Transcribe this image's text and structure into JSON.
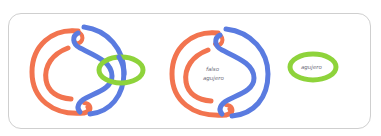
{
  "diagram": {
    "colors": {
      "orange": "#F2744F",
      "blue": "#5A7BE0",
      "green": "#8ED33B",
      "border": "#cfcfcf",
      "text": "#6a6a7a"
    },
    "figures": [
      {
        "id": "linked-with-ring",
        "description": "Orange and blue interlocking C-shaped strands with a green ring threaded through",
        "strands": [
          "orange",
          "blue",
          "green-ring"
        ]
      },
      {
        "id": "false-hole",
        "description": "Orange and blue interlocking C-shaped strands enclosing a labeled region",
        "strands": [
          "orange",
          "blue"
        ],
        "label_line1": "falso",
        "label_line2": "agujero"
      },
      {
        "id": "hole",
        "description": "Green ring enclosing a label",
        "strands": [
          "green-ring"
        ],
        "label": "agujero"
      }
    ]
  }
}
